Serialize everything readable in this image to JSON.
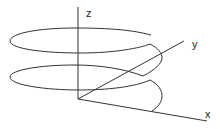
{
  "diagram": {
    "title": "",
    "type": "3d-helix",
    "axes": {
      "z": {
        "label": "z"
      },
      "y": {
        "label": "y"
      },
      "x": {
        "label": "x"
      }
    },
    "colors": {
      "stroke": "#333333",
      "background": "#ffffff",
      "label": "#222222"
    },
    "turns": 2
  }
}
